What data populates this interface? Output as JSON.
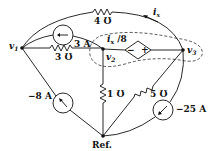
{
  "diagram": {
    "type": "circuit",
    "nodes": [
      {
        "id": "v1",
        "label": "v",
        "sub": "1"
      },
      {
        "id": "v2",
        "label": "v",
        "sub": "2"
      },
      {
        "id": "v3",
        "label": "v",
        "sub": "3"
      },
      {
        "id": "ref",
        "label": "Ref."
      }
    ],
    "components": {
      "r_4": {
        "label": "4 Ʊ",
        "between": [
          "v1",
          "v3"
        ]
      },
      "r_3": {
        "label": "3 Ʊ",
        "between": [
          "v1",
          "v2"
        ]
      },
      "r_1": {
        "label": "1 Ʊ",
        "between": [
          "v2",
          "ref"
        ]
      },
      "r_5": {
        "label": "5 Ʊ",
        "between": [
          "v3",
          "ref"
        ]
      },
      "src_3a": {
        "label": "3 A",
        "between": [
          "v2",
          "v1"
        ],
        "direction": "toward v1"
      },
      "src_m8a": {
        "label": "−8 A",
        "between": [
          "ref",
          "v1"
        ],
        "direction": "toward v1"
      },
      "src_m25a": {
        "label": "−25 A",
        "between": [
          "v3",
          "ref"
        ],
        "direction": "toward ref"
      },
      "dep_src": {
        "label_main": "i",
        "label_sub": "x",
        "label_tail": " /8",
        "minus": "−",
        "plus": "+",
        "between": [
          "v2",
          "v3"
        ]
      }
    },
    "current_ix": {
      "label": "i",
      "sub": "x",
      "direction": "toward v1 along top arc"
    },
    "supernode": {
      "style": "dashed",
      "encloses": [
        "v2",
        "v3",
        "dep_src"
      ]
    }
  }
}
